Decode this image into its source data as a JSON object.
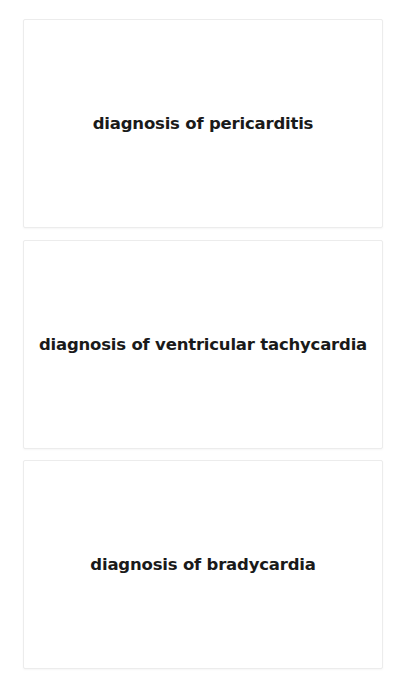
{
  "cards": [
    {
      "label": "diagnosis of pericarditis"
    },
    {
      "label": "diagnosis of ventricular tachycardia"
    },
    {
      "label": "diagnosis of bradycardia"
    }
  ]
}
